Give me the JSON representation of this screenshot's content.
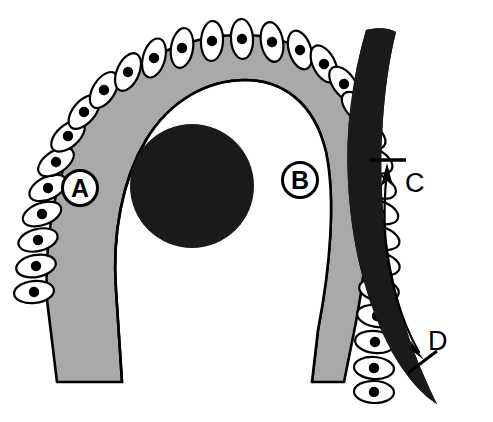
{
  "figure": {
    "background_color": "#ffffff"
  },
  "colors": {
    "tissue_gray": "#a9a9a9",
    "dark_fill": "#1a1a1a",
    "outline_black": "#000000",
    "cell_white": "#ffffff",
    "nucleus_black": "#000000",
    "background": "#ffffff"
  },
  "regions": [
    {
      "id": "gray-tissue-band",
      "name": "gray-tissue-band",
      "fill": "#a9a9a9",
      "description": "U-shaped / inverted-horseshoe gray band forming the main tissue wall"
    },
    {
      "id": "dark-core",
      "name": "dark-core-mass",
      "fill": "#1a1a1a",
      "description": "Solid dark round mass occupying the center of the arch"
    },
    {
      "id": "dark-outer-band",
      "name": "dark-outer-band",
      "fill": "#1a1a1a",
      "description": "Thick dark curved band running down the right side, tapering to a point at the bottom"
    },
    {
      "id": "lumen",
      "name": "lumen-space",
      "fill": "#ffffff",
      "description": "White open channel below the dark core between the two arms"
    }
  ],
  "cell_layer": {
    "name": "epithelial-cell-layer",
    "description": "Row of overlapping lens-shaped (lenticular) cells with round dark nuclei lining the outer convex surface of the gray band",
    "cell_fill": "#ffffff",
    "cell_outline": "#000000",
    "nucleus_fill": "#000000",
    "left_cell_count": 12,
    "right_cell_count": 18
  },
  "labels": {
    "circled": [
      {
        "id": "label-a",
        "text": "A",
        "style": "circled",
        "x": 80,
        "y": 188
      },
      {
        "id": "label-b",
        "text": "B",
        "style": "circled",
        "x": 300,
        "y": 180
      }
    ],
    "arrows": [
      {
        "id": "label-c",
        "text": "C",
        "style": "plain",
        "x": 409,
        "y": 190
      },
      {
        "id": "label-d",
        "text": "D",
        "style": "plain",
        "x": 430,
        "y": 348
      }
    ]
  },
  "annotation_arrow": {
    "name": "double-headed-curved-arrow",
    "description": "Single curved double-headed arrow on the right; upper head points up to a horizontal tick bar (labelled C), lower head points down-right to a short perpendicular tick bar (labelled D)",
    "upper_label": "C",
    "lower_label": "D",
    "stroke": "#000000",
    "stroke_width": 2.2
  }
}
